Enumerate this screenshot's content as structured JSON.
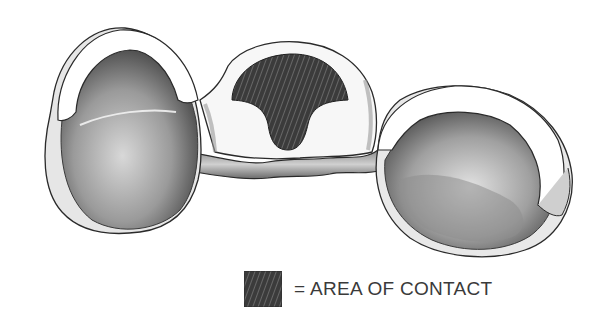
{
  "figure": {
    "parts": {
      "left_abutment": "left-abutment-crown",
      "pontic": "pontic",
      "right_abutment": "right-abutment-crown",
      "connector": "connector-bar"
    },
    "colors": {
      "outline": "#2a2a2a",
      "contact_area": "#3b3b3b",
      "hatch": "#6a6a6a",
      "enamel_light": "#f4f4f4",
      "shade_dark": "#5a5a5a",
      "shade_mid": "#a8a8a8"
    }
  },
  "legend": {
    "symbol": "=",
    "label": "AREA OF CONTACT",
    "text": "= AREA OF CONTACT",
    "swatch_color": "#3b3b3b"
  }
}
